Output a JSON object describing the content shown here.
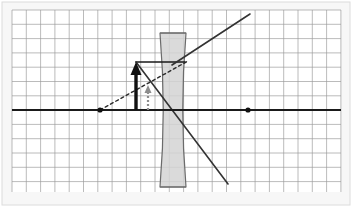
{
  "figure": {
    "type": "optics-ray-diagram",
    "canvas": {
      "width": 352,
      "height": 207
    },
    "background_color": "#ffffff",
    "outer_panel": {
      "fill": "#f7f7f7",
      "border_color": "#dcdcdc",
      "x": 2,
      "y": 2,
      "width": 348,
      "height": 203
    }
  },
  "grid": {
    "label": "graph-paper-grid",
    "x": 12,
    "y": 10,
    "width": 329,
    "height": 182,
    "cell_size": 14.3,
    "line_color": "#9a9a9a",
    "minor_line_color": "#c9c9c9",
    "visible": true,
    "columns": 23,
    "rows": 13
  },
  "optical_axis": {
    "label": "principal-axis",
    "y": 110,
    "x_start": 12,
    "x_end": 341,
    "color": "#1a1a1a",
    "stroke_width": 2.2
  },
  "lens": {
    "label": "diverging-concave-lens",
    "kind": "biconcave",
    "center_x": 173,
    "top_y": 33,
    "bottom_y": 187,
    "top_half_width": 13,
    "waist_half_width": 5,
    "fill": "#d4d4d4",
    "fill_opacity": 0.85,
    "stroke": "#6b6b6b",
    "stroke_width": 1.2
  },
  "focal_points": [
    {
      "name": "left-focal-point",
      "label": "F",
      "x": 100,
      "y": 110,
      "radius": 2.6,
      "color": "#111111"
    },
    {
      "name": "right-focal-point",
      "label": "F'",
      "x": 248,
      "y": 110,
      "radius": 2.6,
      "color": "#111111"
    }
  ],
  "object_arrow": {
    "label": "object-arrow",
    "x": 136,
    "base_y": 110,
    "tip_y": 62,
    "color": "#111111",
    "stroke_width": 3.4,
    "head_width": 11,
    "head_length": 13
  },
  "image_arrow": {
    "label": "image-arrow",
    "x": 148,
    "base_y": 110,
    "tip_y": 85,
    "color": "#8d8d8d",
    "stroke_width": 2.2,
    "dash": "2,2",
    "head_width": 7,
    "head_length": 8
  },
  "rays": [
    {
      "name": "parallel-ray-incident",
      "style": "solid",
      "color": "#1a1a1a",
      "stroke_width": 1.6,
      "points": [
        [
          136,
          62
        ],
        [
          185,
          62
        ]
      ]
    },
    {
      "name": "refracted-ray-diverging",
      "style": "solid",
      "color": "#333333",
      "stroke_width": 1.6,
      "points": [
        [
          172,
          65
        ],
        [
          250,
          14
        ]
      ]
    },
    {
      "name": "chief-ray-through-center",
      "style": "solid",
      "color": "#333333",
      "stroke_width": 1.6,
      "points": [
        [
          136,
          62
        ],
        [
          228,
          184
        ]
      ]
    },
    {
      "name": "virtual-ray-extension",
      "style": "dashed",
      "color": "#2a2a2a",
      "stroke_width": 1.4,
      "dash": "3,3",
      "points": [
        [
          100,
          110
        ],
        [
          188,
          61
        ]
      ]
    }
  ],
  "legend": {
    "visible": false,
    "entries": []
  },
  "annotations": []
}
